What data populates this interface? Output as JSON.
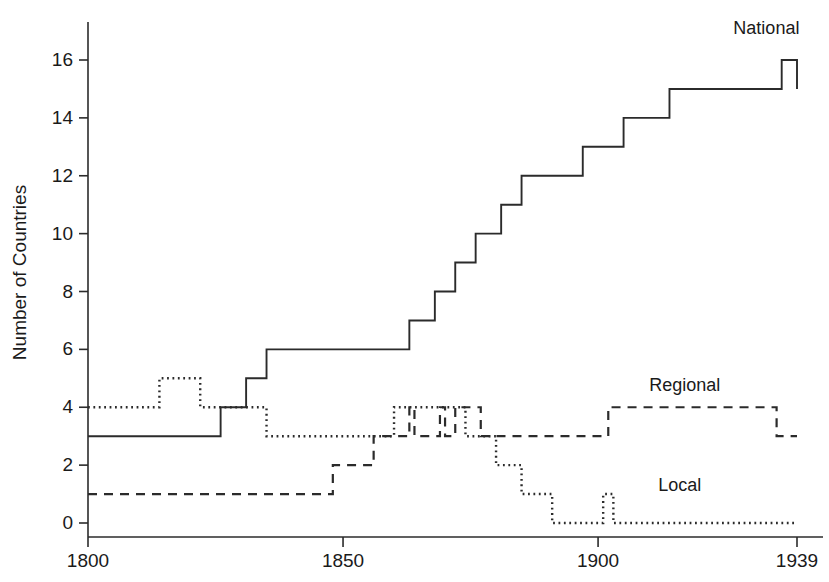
{
  "chart_data": {
    "type": "line",
    "title": "",
    "subtitle": "",
    "xlabel": "",
    "ylabel": "Number of Countries",
    "xlim": [
      1800,
      1939
    ],
    "ylim": [
      0,
      17
    ],
    "xticks": [
      1800,
      1850,
      1900,
      1939
    ],
    "xtick_labels": [
      "1800",
      "1850",
      "1900",
      "1939"
    ],
    "yticks": [
      0,
      2,
      4,
      6,
      8,
      10,
      12,
      14,
      16
    ],
    "ytick_labels": [
      "0",
      "2",
      "4",
      "6",
      "8",
      "10",
      "12",
      "14",
      "16"
    ],
    "grid": false,
    "legend_position": "inline-right-of-series",
    "step_style": "post",
    "series": [
      {
        "name": "National",
        "label": "National",
        "style": "solid",
        "label_x": 1933,
        "label_y": 16.9,
        "points": [
          [
            1800,
            3
          ],
          [
            1826,
            3
          ],
          [
            1826,
            4
          ],
          [
            1831,
            4
          ],
          [
            1831,
            5
          ],
          [
            1835,
            5
          ],
          [
            1835,
            6
          ],
          [
            1863,
            6
          ],
          [
            1863,
            7
          ],
          [
            1868,
            7
          ],
          [
            1868,
            8
          ],
          [
            1872,
            8
          ],
          [
            1872,
            9
          ],
          [
            1876,
            9
          ],
          [
            1876,
            10
          ],
          [
            1881,
            10
          ],
          [
            1881,
            11
          ],
          [
            1885,
            11
          ],
          [
            1885,
            12
          ],
          [
            1897,
            12
          ],
          [
            1897,
            13
          ],
          [
            1905,
            13
          ],
          [
            1905,
            14
          ],
          [
            1914,
            14
          ],
          [
            1914,
            15
          ],
          [
            1936,
            15
          ],
          [
            1936,
            16
          ],
          [
            1939,
            16
          ],
          [
            1939,
            15
          ]
        ]
      },
      {
        "name": "Regional",
        "label": "Regional",
        "style": "dashed",
        "label_x": 1917,
        "label_y": 4.55,
        "points": [
          [
            1800,
            1
          ],
          [
            1848,
            1
          ],
          [
            1848,
            2
          ],
          [
            1856,
            2
          ],
          [
            1856,
            3
          ],
          [
            1863,
            3
          ],
          [
            1863,
            4
          ],
          [
            1864,
            4
          ],
          [
            1864,
            3
          ],
          [
            1869,
            3
          ],
          [
            1869,
            4
          ],
          [
            1870,
            4
          ],
          [
            1870,
            3
          ],
          [
            1872,
            3
          ],
          [
            1872,
            4
          ],
          [
            1877,
            4
          ],
          [
            1877,
            3
          ],
          [
            1902,
            3
          ],
          [
            1902,
            4
          ],
          [
            1935,
            4
          ],
          [
            1935,
            3
          ],
          [
            1939,
            3
          ]
        ]
      },
      {
        "name": "Local",
        "label": "Local",
        "style": "dotted",
        "label_x": 1916,
        "label_y": 1.1,
        "points": [
          [
            1800,
            4
          ],
          [
            1814,
            4
          ],
          [
            1814,
            5
          ],
          [
            1822,
            5
          ],
          [
            1822,
            4
          ],
          [
            1835,
            4
          ],
          [
            1835,
            3
          ],
          [
            1860,
            3
          ],
          [
            1860,
            4
          ],
          [
            1874,
            4
          ],
          [
            1874,
            3
          ],
          [
            1880,
            3
          ],
          [
            1880,
            2
          ],
          [
            1885,
            2
          ],
          [
            1885,
            1
          ],
          [
            1891,
            1
          ],
          [
            1891,
            0
          ],
          [
            1901,
            0
          ],
          [
            1901,
            1
          ],
          [
            1903,
            1
          ],
          [
            1903,
            0
          ],
          [
            1939,
            0
          ]
        ]
      }
    ]
  },
  "axes": {
    "y_title": "Number of Countries"
  }
}
